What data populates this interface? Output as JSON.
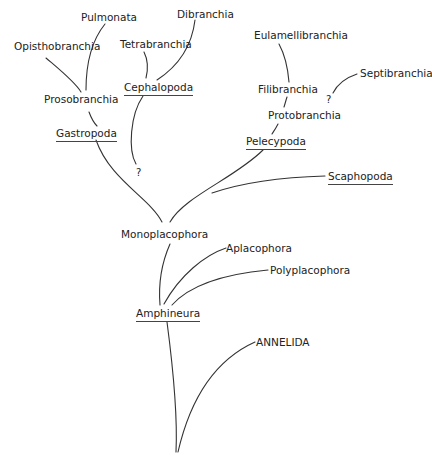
{
  "diagram": {
    "type": "phylogenetic-tree",
    "root": "ANNELIDA",
    "colors": {
      "line": "#333333",
      "text": "#222222",
      "background": "#ffffff"
    },
    "nodes": {
      "pulmonata": "Pulmonata",
      "dibranchia": "Dibranchia",
      "opisthobranchia": "Opisthobranchia",
      "tetrabranchia": "Tetrabranchia",
      "eulamellibranchia": "Eulamellibranchia",
      "septibranchia": "Septibranchia",
      "cephalopoda": "Cephalopoda",
      "filibranchia": "Filibranchia",
      "prosobranchia": "Prosobranchia",
      "protobranchia": "Protobranchia",
      "gastropoda": "Gastropoda",
      "pelecypoda": "Pelecypoda",
      "scaphopoda": "Scaphopoda",
      "monoplacophora": "Monoplacophora",
      "aplacophora": "Aplacophora",
      "polyplacophora": "Polyplacophora",
      "amphineura": "Amphineura",
      "annelida": "ANNELIDA",
      "uncertain_cephalopoda": "?",
      "uncertain_septibranchia": "?"
    },
    "class_labels_underlined": [
      "Cephalopoda",
      "Gastropoda",
      "Pelecypoda",
      "Scaphopoda",
      "Amphineura"
    ],
    "edges": [
      [
        "ANNELIDA-base",
        "Amphineura"
      ],
      [
        "ANNELIDA-base",
        "ANNELIDA"
      ],
      [
        "Amphineura",
        "Monoplacophora"
      ],
      [
        "Amphineura",
        "Aplacophora"
      ],
      [
        "Amphineura",
        "Polyplacophora"
      ],
      [
        "Monoplacophora",
        "Gastropoda"
      ],
      [
        "Monoplacophora",
        "Pelecypoda"
      ],
      [
        "Monoplacophora",
        "Scaphopoda"
      ],
      [
        "Monoplacophora",
        "Cephalopoda (?)"
      ],
      [
        "Gastropoda",
        "Prosobranchia"
      ],
      [
        "Prosobranchia",
        "Opisthobranchia"
      ],
      [
        "Prosobranchia",
        "Pulmonata"
      ],
      [
        "Cephalopoda",
        "Tetrabranchia"
      ],
      [
        "Cephalopoda",
        "Dibranchia"
      ],
      [
        "Pelecypoda",
        "Protobranchia"
      ],
      [
        "Protobranchia",
        "Filibranchia"
      ],
      [
        "Filibranchia",
        "Eulamellibranchia"
      ],
      [
        "Protobranchia",
        "Septibranchia (?)"
      ]
    ]
  }
}
